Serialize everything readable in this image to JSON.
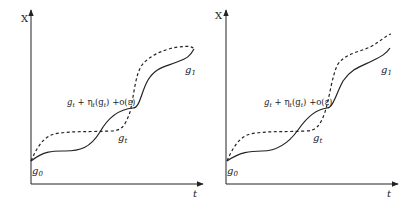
{
  "panels": [
    {
      "y_axis_label": "X",
      "x_axis_label": "t",
      "start_label": "g",
      "start_sub": "0",
      "end_label": "g",
      "end_sub": "1",
      "mid_label": "g",
      "mid_sub": "t",
      "expr_label": "g",
      "expr_sub": "t",
      "expr_rest": " + η",
      "expr_eta_sub": "t",
      "expr_arg": "(g",
      "expr_arg_sub": "t",
      "expr_tail": ") +o(ε)"
    },
    {
      "y_axis_label": "X",
      "x_axis_label": "t",
      "start_label": "g",
      "start_sub": "0",
      "end_label": "g",
      "end_sub": "1",
      "mid_label": "g",
      "mid_sub": "t",
      "expr_label": "g",
      "expr_sub": "t",
      "expr_rest": " + η",
      "expr_eta_sub": "t",
      "expr_arg": "(g",
      "expr_arg_sub": "t",
      "expr_tail": ") +o(ε)"
    }
  ],
  "colors": {
    "line": "#222222",
    "background": "#ffffff"
  }
}
